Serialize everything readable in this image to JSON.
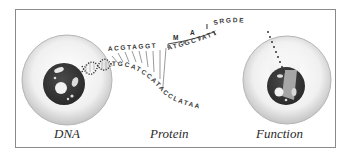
{
  "diagram": {
    "title": "",
    "stages": [
      {
        "id": "dna",
        "label": "DNA"
      },
      {
        "id": "protein",
        "label": "Protein"
      },
      {
        "id": "function",
        "label": "Function"
      }
    ],
    "sequences": {
      "dna_upper_strand": "ACGTAGGT",
      "dna_lower_strand": "TGCATCCATACCLATAA",
      "codon_strand": "ATGGCTATT",
      "amino_acids": [
        "M",
        "A",
        "I"
      ],
      "peptide_tail": "SRGDE"
    },
    "colors": {
      "frame": "#8a8a8a",
      "cell_membrane": "#d8d8d8",
      "nucleus": "#3a3a3a",
      "text": "#2a2a2a"
    }
  }
}
